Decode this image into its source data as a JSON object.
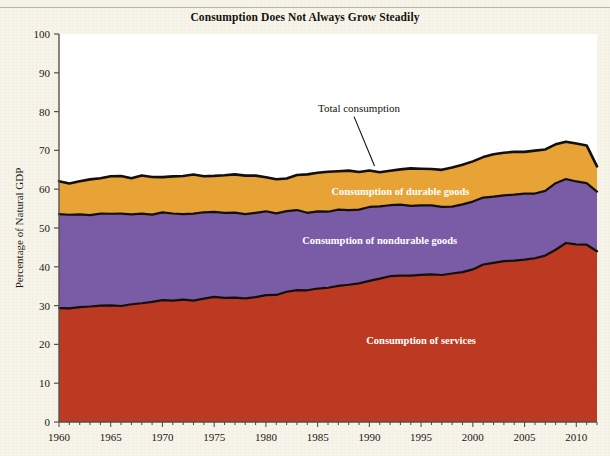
{
  "chart_data": {
    "type": "area",
    "title": "Consumption Does Not Always Grow Steadily",
    "xlabel": "",
    "ylabel": "Percentage of Natural GDP",
    "ylim": [
      0,
      100
    ],
    "xlim": [
      1960,
      2012
    ],
    "ytick_step": 10,
    "yticks": [
      "0",
      "10",
      "20",
      "30",
      "40",
      "50",
      "60",
      "70",
      "80",
      "90",
      "100"
    ],
    "xticks": [
      "1960",
      "1965",
      "1970",
      "1975",
      "1980",
      "1985",
      "1990",
      "1995",
      "2000",
      "2005",
      "2010"
    ],
    "grid": false,
    "legend_position": "inline-labels",
    "stacked": true,
    "colors": {
      "services": "#bc3a21",
      "nondurable_goods": "#7a5ba6",
      "durable_goods": "#e8a337",
      "outline": "#120f0c",
      "background": "#ffffff",
      "page": "#f7f5ea"
    },
    "annotations": [
      {
        "text": "Total consumption",
        "x": 1989,
        "y": 80,
        "pointer_to_x": 1990.5,
        "pointer_to_y": 66.0
      },
      {
        "text": "Consumption of durable goods",
        "x": 1993,
        "y": 58.5
      },
      {
        "text": "Consumption of nondurable goods",
        "x": 1991,
        "y": 45.8
      },
      {
        "text": "Consumption of services",
        "x": 1995,
        "y": 20.0
      }
    ],
    "x": [
      1960,
      1961,
      1962,
      1963,
      1964,
      1965,
      1966,
      1967,
      1968,
      1969,
      1970,
      1971,
      1972,
      1973,
      1974,
      1975,
      1976,
      1977,
      1978,
      1979,
      1980,
      1981,
      1982,
      1983,
      1984,
      1985,
      1986,
      1987,
      1988,
      1989,
      1990,
      1991,
      1992,
      1993,
      1994,
      1995,
      1996,
      1997,
      1998,
      1999,
      2000,
      2001,
      2002,
      2003,
      2004,
      2005,
      2006,
      2007,
      2008,
      2009,
      2010,
      2011,
      2012
    ],
    "series": [
      {
        "name": "Consumption of services",
        "values": [
          29.2,
          29.4,
          29.6,
          29.8,
          30.0,
          30.0,
          30.0,
          30.4,
          30.6,
          30.8,
          31.3,
          31.4,
          31.4,
          31.2,
          31.8,
          32.1,
          32.0,
          32.0,
          31.9,
          32.1,
          32.7,
          32.7,
          33.6,
          34.1,
          34.0,
          34.4,
          34.8,
          35.2,
          35.4,
          35.6,
          36.3,
          37.0,
          37.6,
          37.8,
          37.7,
          37.8,
          37.9,
          37.9,
          38.2,
          38.6,
          39.2,
          40.6,
          41.1,
          41.4,
          41.5,
          41.9,
          42.2,
          43.0,
          44.5,
          46.2,
          45.9,
          45.6,
          44.0
        ]
      },
      {
        "name": "Consumption of nondurable goods",
        "values": [
          24.3,
          24.0,
          23.9,
          23.6,
          23.6,
          23.6,
          23.7,
          23.1,
          23.1,
          22.8,
          22.7,
          22.3,
          22.2,
          22.4,
          22.3,
          22.1,
          22.0,
          21.8,
          21.6,
          21.7,
          21.5,
          21.2,
          20.7,
          20.4,
          20.0,
          19.8,
          19.5,
          19.4,
          19.3,
          19.2,
          19.1,
          18.6,
          18.3,
          18.2,
          18.1,
          18.0,
          17.8,
          17.6,
          17.4,
          17.4,
          17.5,
          17.2,
          17.1,
          17.0,
          17.0,
          16.9,
          16.8,
          16.6,
          16.9,
          16.3,
          16.1,
          16.0,
          15.4
        ]
      },
      {
        "name": "Consumption of durable goods",
        "values": [
          8.7,
          8.1,
          8.6,
          9.0,
          9.2,
          9.7,
          9.7,
          9.3,
          9.8,
          9.6,
          9.0,
          9.5,
          9.9,
          10.1,
          9.2,
          9.1,
          9.6,
          9.9,
          10.0,
          9.7,
          8.9,
          8.8,
          8.6,
          9.2,
          9.7,
          10.0,
          10.3,
          10.0,
          10.0,
          9.8,
          9.4,
          8.9,
          8.9,
          9.2,
          9.5,
          9.4,
          9.4,
          9.5,
          10.0,
          10.3,
          10.5,
          10.6,
          10.8,
          11.0,
          11.0,
          10.9,
          10.8,
          10.6,
          10.1,
          9.7,
          9.8,
          9.7,
          6.6
        ]
      }
    ]
  },
  "title_text": "Consumption Does Not Always Grow Steadily",
  "y_axis_title": "Percentage of Natural GDP",
  "labels": {
    "total_consumption": "Total consumption",
    "durable_goods": "Consumption of durable goods",
    "nondurable_goods": "Consumption of nondurable goods",
    "services": "Consumption of services"
  }
}
